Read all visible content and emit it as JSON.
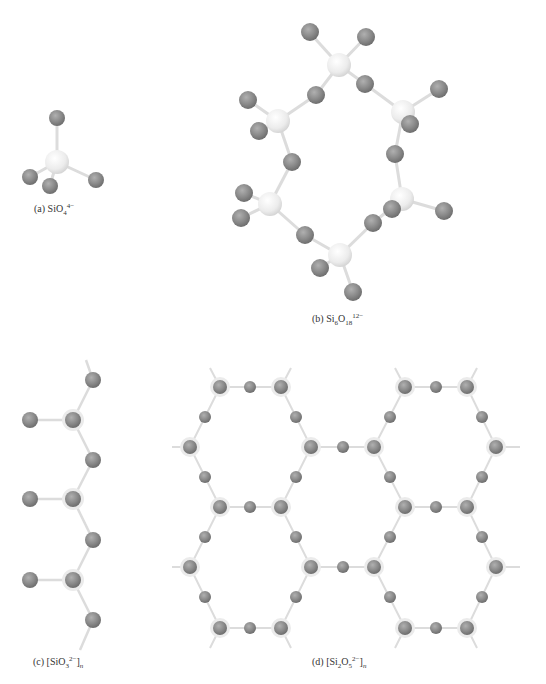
{
  "figure": {
    "panels": [
      {
        "id": "a",
        "label": "(a) SiO",
        "sub": "4",
        "sup": "4−",
        "suffix": "",
        "structure": "isolated tetrahedron"
      },
      {
        "id": "b",
        "label": "(b) Si",
        "sub1": "6",
        "mid": "O",
        "sub": "18",
        "sup": "12−",
        "structure": "cyclic silicate ring"
      },
      {
        "id": "c",
        "label": "(c) [SiO",
        "sub": "3",
        "sup": "2−",
        "close": "]",
        "n": "n",
        "structure": "single chain"
      },
      {
        "id": "d",
        "label": "(d) [Si",
        "sub1": "2",
        "mid": "O",
        "sub": "5",
        "sup": "2−",
        "close": "]",
        "n": "n",
        "structure": "sheet"
      }
    ],
    "colors": {
      "silicon": "#e6e6e6",
      "oxygen": "#8a8a8a",
      "bond": "#d9d9d9",
      "halo": "#e8e8e8"
    }
  }
}
